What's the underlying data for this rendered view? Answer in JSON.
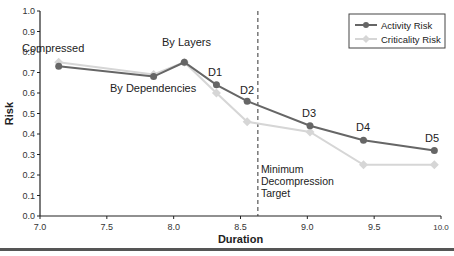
{
  "chart_data": {
    "type": "line",
    "title": "",
    "xlabel": "Duration",
    "ylabel": "Risk",
    "xlim": [
      7.0,
      10.0
    ],
    "ylim": [
      0.0,
      1.0
    ],
    "x_ticks": [
      "7.0",
      "7.5",
      "8.0",
      "8.5",
      "9.0",
      "9.5",
      "10.0"
    ],
    "y_ticks": [
      "0.0",
      "0.1",
      "0.2",
      "0.3",
      "0.4",
      "0.5",
      "0.6",
      "0.7",
      "0.8",
      "0.9",
      "1.0"
    ],
    "grid": false,
    "legend_position": "top-right",
    "series": [
      {
        "name": "Activity Risk",
        "color": "#666666",
        "marker": "circle",
        "x": [
          7.14,
          7.85,
          8.08,
          8.32,
          8.55,
          9.02,
          9.42,
          9.95
        ],
        "values": [
          0.73,
          0.68,
          0.75,
          0.64,
          0.56,
          0.44,
          0.37,
          0.32
        ]
      },
      {
        "name": "Criticality Risk",
        "color": "#d6d6d6",
        "marker": "diamond",
        "x": [
          7.14,
          7.85,
          8.08,
          8.32,
          8.55,
          9.02,
          9.42,
          9.95
        ],
        "values": [
          0.75,
          0.69,
          0.75,
          0.6,
          0.46,
          0.41,
          0.25,
          0.25
        ]
      }
    ],
    "point_labels": [
      "Compressed",
      "By Dependencies",
      "By Layers",
      "D1",
      "D2",
      "D3",
      "D4",
      "D5"
    ],
    "annotations": [
      {
        "type": "vline",
        "x": 8.63,
        "style": "dashed",
        "text": [
          "Minimum",
          "Decompression",
          "Target"
        ]
      }
    ]
  }
}
